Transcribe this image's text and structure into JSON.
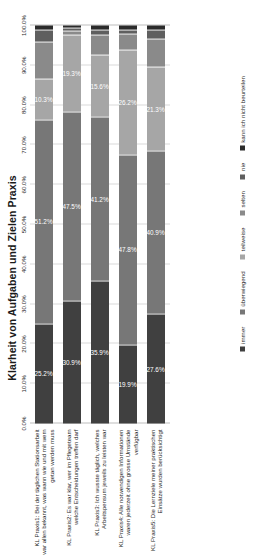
{
  "chart_data": {
    "type": "bar",
    "orientation": "horizontal-stacked-rotated",
    "title": "Klarheit von Aufgaben und Zielen Praxis",
    "xlabel": "",
    "ylabel": "",
    "xlim": [
      0,
      100
    ],
    "grid": true,
    "legend_position": "bottom",
    "tick_labels": [
      "0.0%",
      "10.0%",
      "20.0%",
      "30.0%",
      "40.0%",
      "50.0%",
      "60.0%",
      "70.0%",
      "80.0%",
      "90.0%",
      "100.0%"
    ],
    "tick_values": [
      0,
      10,
      20,
      30,
      40,
      50,
      60,
      70,
      80,
      90,
      100
    ],
    "categories": [
      "KL Praxis1: Bei der täglichen Stationsarbeit war allen bekannt, was wann wie und mit wem getan werden muss",
      "KL Praxis2: Es war klar, wer im Pflegeteam welche Entscheidungen treffen darf",
      "KL Praxis3: Ich wusste täglich, welches Arbeitspensum jeweils zu leisten war",
      "KL Praxis4: Alle notwendigen Informationen waren jederzeit ohne grosse Umstände verfügbar",
      "KL Praxis5: Die Lernziele meiner praktischen Einsätze wurden berücksichtigt"
    ],
    "series": [
      {
        "name": "immer",
        "color": "#404040",
        "values": [
          25.2,
          30.9,
          35.9,
          19.9,
          27.6
        ],
        "labels": [
          "25.2%",
          "30.9%",
          "35.9%",
          "19.9%",
          "27.6%"
        ]
      },
      {
        "name": "überwiegend",
        "color": "#777777",
        "values": [
          51.2,
          47.5,
          41.2,
          47.8,
          40.9
        ],
        "labels": [
          "51.2%",
          "47.5%",
          "41.2%",
          "47.8%",
          "40.9%"
        ]
      },
      {
        "name": "teilweise",
        "color": "#a6a6a6",
        "values": [
          10.3,
          19.3,
          15.6,
          26.2,
          21.3
        ],
        "labels": [
          "10.3%",
          "19.3%",
          "15.6%",
          "26.2%",
          "21.3%"
        ]
      },
      {
        "name": "selten",
        "color": "#8a8a8a",
        "values": [
          9.2,
          1.0,
          5.0,
          4.1,
          7.0
        ],
        "labels": [
          "",
          "",
          "",
          "",
          ""
        ]
      },
      {
        "name": "nie",
        "color": "#5f5f5f",
        "values": [
          3.1,
          0.8,
          1.2,
          1.0,
          2.2
        ],
        "labels": [
          "",
          "",
          "",
          "",
          ""
        ]
      },
      {
        "name": "kann ich nicht beurteilen",
        "color": "#2b2b2b",
        "values": [
          1.0,
          0.5,
          1.1,
          1.0,
          1.0
        ],
        "labels": [
          "",
          "",
          "",
          "",
          ""
        ]
      }
    ]
  }
}
